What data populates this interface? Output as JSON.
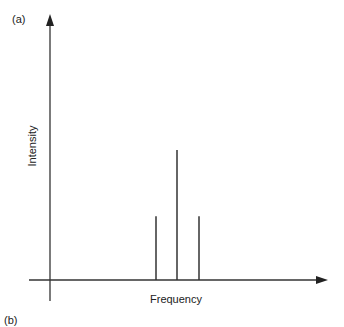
{
  "panel_labels": {
    "top": "(a)",
    "bottom": "(b)"
  },
  "chart_data": {
    "type": "bar",
    "title": "",
    "xlabel": "Frequency",
    "ylabel": "Intensity",
    "categories": [
      "f-1",
      "f0",
      "f+1"
    ],
    "values": [
      0.49,
      1.0,
      0.49
    ],
    "grid": false,
    "axis_ticks": false
  },
  "colors": {
    "line": "#333333",
    "background": "#ffffff"
  }
}
